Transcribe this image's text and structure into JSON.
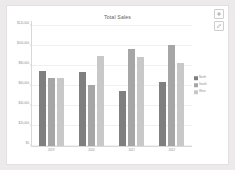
{
  "card": {
    "background": "#ffffff",
    "page_background": "#eceaea"
  },
  "controls": [
    {
      "name": "add-button",
      "icon": "plus-icon",
      "label": "+"
    },
    {
      "name": "edit-button",
      "icon": "pencil-icon",
      "label": ""
    }
  ],
  "chart_data": {
    "type": "bar",
    "title": "Total Sales",
    "xlabel": "",
    "ylabel": "",
    "categories": [
      "2019",
      "2020",
      "2021",
      "2022"
    ],
    "series": [
      {
        "name": "North",
        "color": "#7f7f7f",
        "values": [
          75000,
          74000,
          55000,
          64000
        ]
      },
      {
        "name": "South",
        "color": "#a6a6a6",
        "values": [
          68000,
          61000,
          97000,
          101000
        ]
      },
      {
        "name": "West",
        "color": "#c8c8c8",
        "values": [
          68500,
          90000,
          89000,
          83000
        ]
      }
    ],
    "ylim": [
      0,
      125000
    ],
    "yticks": [
      0,
      20000,
      40000,
      60000,
      80000,
      100000,
      120000
    ],
    "ytick_labels": [
      "$0",
      "$20,000",
      "$40,000",
      "$60,000",
      "$80,000",
      "$100,000",
      "$120,000"
    ],
    "grid": true,
    "legend_position": "right"
  }
}
